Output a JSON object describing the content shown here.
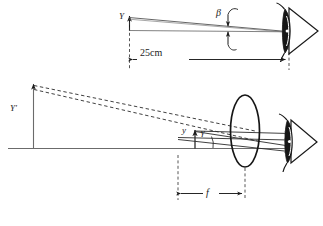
{
  "figure": {
    "colors": {
      "ink": "#1a1a1a",
      "ray": "#3a3a3a",
      "axis": "#6b6b6b",
      "dashed": "#2b2b2b",
      "background": "#ffffff"
    }
  },
  "top_diagram": {
    "name": "unaided-eye-view",
    "object_label": "Y",
    "angle_label": "β",
    "distance_label": "25cm",
    "eye_icon": "eye-icon",
    "description": "Object of height Y viewed by unaided eye at the near point, subtending visual angle beta."
  },
  "bottom_diagram": {
    "name": "magnifier-view",
    "image_label": "Y′",
    "object_label": "y",
    "angle_label": "γ",
    "focal_length_label": "f",
    "lens_icon": "converging-lens-icon",
    "eye_icon": "eye-icon",
    "description": "Object y at the focal plane of a converging lens of focal length f forms an enlarged virtual image Y' subtending angle gamma at the eye."
  }
}
